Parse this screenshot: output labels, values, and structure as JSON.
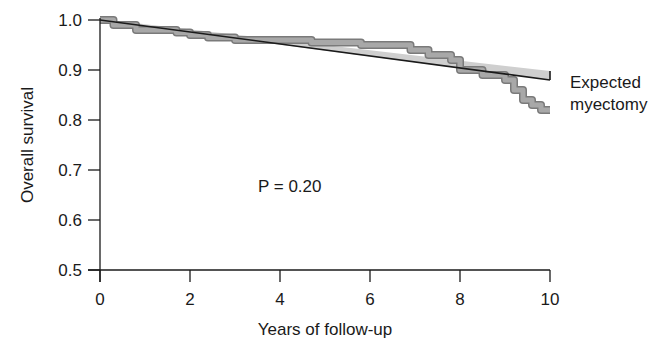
{
  "chart_data": {
    "type": "line",
    "title": "",
    "xlabel": "Years of follow-up",
    "ylabel": "Overall survival",
    "xlim": [
      0,
      10
    ],
    "ylim": [
      0.5,
      1.0
    ],
    "xticks": [
      0,
      2,
      4,
      6,
      8,
      10
    ],
    "xtick_labels": [
      "0",
      "2",
      "4",
      "6",
      "8",
      "10"
    ],
    "yticks": [
      0.5,
      0.6,
      0.7,
      0.8,
      0.9,
      1.0
    ],
    "ytick_labels": [
      "0.5",
      "0.6",
      "0.7",
      "0.8",
      "0.9",
      "1.0"
    ],
    "grid": false,
    "legend_position": "right (direct labels)",
    "annotations": [
      {
        "text": "P = 0.20",
        "x": 3.6,
        "y": 0.73
      }
    ],
    "series": [
      {
        "name": "Expected",
        "style": "straight line with light gray band",
        "color": "#1a1a1a",
        "x": [
          0,
          10
        ],
        "y": [
          1.0,
          0.88
        ]
      },
      {
        "name": "myectomy",
        "style": "Kaplan-Meier step curve with gray band",
        "color": "#8c8c8c",
        "x": [
          0,
          0.3,
          0.8,
          1.7,
          2.0,
          2.4,
          3.0,
          4.0,
          4.7,
          5.2,
          5.8,
          6.6,
          6.9,
          7.3,
          7.8,
          8.0,
          8.5,
          9.0,
          9.2,
          9.4,
          9.6,
          9.8,
          10.0
        ],
        "y": [
          1.0,
          0.99,
          0.98,
          0.975,
          0.97,
          0.965,
          0.96,
          0.96,
          0.955,
          0.955,
          0.95,
          0.95,
          0.94,
          0.93,
          0.92,
          0.9,
          0.89,
          0.88,
          0.86,
          0.84,
          0.83,
          0.82,
          0.82
        ]
      }
    ]
  },
  "labels": {
    "expected": "Expected",
    "myectomy": "myectomy",
    "p_value": "P = 0.20",
    "x_axis_title": "Years of follow-up",
    "y_axis_title": "Overall survival"
  }
}
